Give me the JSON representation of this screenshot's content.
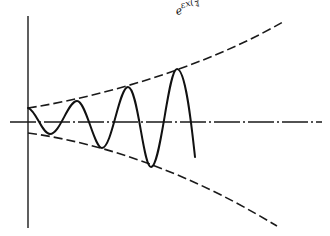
{
  "diagram": {
    "envelope_label": {
      "base": "e",
      "exponent_prefix": "εx",
      "open_paren": "(",
      "frac1_num": "1",
      "frac1_den": "4",
      "minus1": " − σ",
      "sigma_power": "2",
      "close_paren": ")",
      "paren_power": "1/2",
      "minus2": " − ",
      "frac2_num": "β",
      "frac2_den": "2"
    },
    "elements": {
      "vertical_axis": "solid",
      "horizontal_axis": "dash-dot",
      "upper_envelope": "dashed",
      "lower_envelope": "dashed",
      "oscillation": "solid"
    },
    "oscillation": {
      "cycles_shown": 3.5,
      "starts_at": "upper envelope at x=0",
      "growth": "amplitude grows exponentially with x"
    },
    "colors": {
      "ink": "#1a1a1a",
      "background": "#ffffff"
    }
  }
}
